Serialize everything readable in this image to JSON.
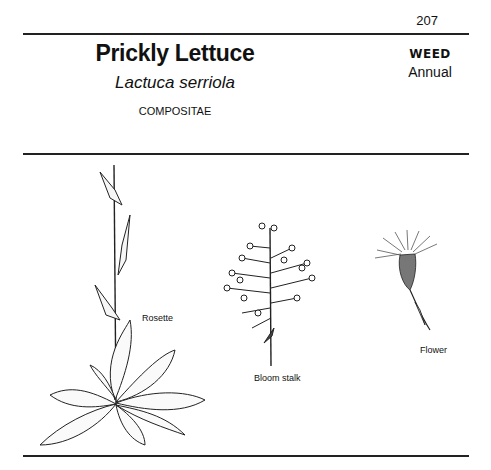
{
  "page": {
    "page_number": "207",
    "common_name": "Prickly Lettuce",
    "scientific_name": "Lactuca serriola",
    "family": "COMPOSITAE",
    "category": "WEED",
    "life_cycle": "Annual"
  },
  "illustrations": {
    "rosette_label": "Rosette",
    "bloom_stalk_label": "Bloom stalk",
    "flower_label": "Flower"
  }
}
